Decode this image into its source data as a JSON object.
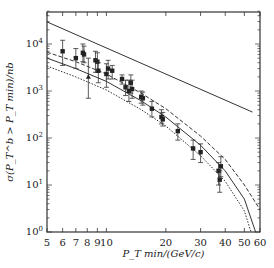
{
  "chart_data": {
    "type": "scatter",
    "title": "",
    "xlabel": "P_T min/(GeV/c)",
    "ylabel": "σ(P_T^b > P_T min)/nb",
    "xscale": "log",
    "yscale": "log",
    "xlim": [
      5,
      60
    ],
    "ylim": [
      1,
      50000
    ],
    "x_ticks": [
      5,
      6,
      7,
      8,
      9,
      10,
      20,
      30,
      40,
      50,
      60
    ],
    "x_tick_labels": [
      "5",
      "6",
      "7",
      "8",
      "9",
      "10",
      "20",
      "30",
      "40",
      "50",
      "60"
    ],
    "y_ticks": [
      1,
      10,
      100,
      1000,
      10000
    ],
    "y_tick_labels": [
      "10^0",
      "10^1",
      "10^2",
      "10^3",
      "10^4"
    ],
    "grid": false,
    "legend": null,
    "series": [
      {
        "name": "upper straight line",
        "style": "solid",
        "x": [
          5,
          55
        ],
        "y": [
          29500,
          355
        ]
      },
      {
        "name": "theory upper (dash)",
        "style": "dashed",
        "x": [
          5,
          7,
          10,
          15,
          20,
          30,
          40,
          50,
          60
        ],
        "y": [
          6700,
          4200,
          2300,
          900,
          420,
          110,
          35,
          10,
          3
        ]
      },
      {
        "name": "theory central (solid)",
        "style": "solid",
        "x": [
          5,
          7,
          10,
          15,
          20,
          30,
          40,
          50,
          57
        ],
        "y": [
          5000,
          3000,
          1600,
          620,
          280,
          70,
          20,
          5,
          1
        ]
      },
      {
        "name": "theory lower (dotted)",
        "style": "dotted",
        "x": [
          5,
          7,
          10,
          15,
          20,
          30,
          40,
          50,
          54
        ],
        "y": [
          3400,
          2000,
          1050,
          400,
          180,
          42,
          12,
          2.8,
          1
        ]
      },
      {
        "name": "data",
        "style": "points",
        "points": [
          {
            "x": 6.0,
            "y": 7000,
            "err": [
              3500,
              12000
            ]
          },
          {
            "x": 7.0,
            "y": 5000,
            "err": [
              3000,
              8000
            ]
          },
          {
            "x": 7.6,
            "y": 6500,
            "err": [
              4200,
              10000
            ]
          },
          {
            "x": 7.7,
            "y": 6000,
            "err": [
              4000,
              9000
            ]
          },
          {
            "x": 8.1,
            "y": 2000,
            "err": [
              700,
              5000
            ],
            "marker": "triangle"
          },
          {
            "x": 8.8,
            "y": 4500,
            "err": [
              2500,
              7000
            ]
          },
          {
            "x": 9.0,
            "y": 4200,
            "err": [
              2500,
              6500
            ]
          },
          {
            "x": 9.1,
            "y": 2700,
            "err": [
              1500,
              4000
            ]
          },
          {
            "x": 10.0,
            "y": 2300,
            "err": [
              1200,
              3800
            ]
          },
          {
            "x": 10.2,
            "y": 3000,
            "err": [
              1800,
              4500
            ]
          },
          {
            "x": 10.7,
            "y": 2700,
            "err": [
              1800,
              3500
            ]
          },
          {
            "x": 12.0,
            "y": 1800,
            "err": [
              1400,
              2200
            ]
          },
          {
            "x": 12.5,
            "y": 1200,
            "err": [
              800,
              1700
            ]
          },
          {
            "x": 13.0,
            "y": 1000,
            "err": [
              600,
              1700
            ]
          },
          {
            "x": 13.3,
            "y": 1500,
            "err": [
              900,
              2200
            ]
          },
          {
            "x": 13.5,
            "y": 1100,
            "err": [
              700,
              1700
            ]
          },
          {
            "x": 15.0,
            "y": 750,
            "err": [
              550,
              1000
            ]
          },
          {
            "x": 15.3,
            "y": 700,
            "err": [
              500,
              950
            ]
          },
          {
            "x": 17.0,
            "y": 420,
            "err": [
              280,
              600
            ]
          },
          {
            "x": 19.0,
            "y": 280,
            "err": [
              200,
              400
            ]
          },
          {
            "x": 19.3,
            "y": 250,
            "err": [
              180,
              350
            ]
          },
          {
            "x": 23.0,
            "y": 140,
            "err": [
              90,
              200
            ]
          },
          {
            "x": 27.5,
            "y": 60,
            "err": [
              35,
              90
            ]
          },
          {
            "x": 30.0,
            "y": 50,
            "err": [
              30,
              75
            ]
          },
          {
            "x": 37.0,
            "y": 20,
            "err": [
              10,
              30
            ]
          },
          {
            "x": 37.5,
            "y": 13,
            "err": [
              7,
              20
            ]
          },
          {
            "x": 38.0,
            "y": 25,
            "err": [
              15,
              40
            ]
          }
        ]
      }
    ]
  }
}
